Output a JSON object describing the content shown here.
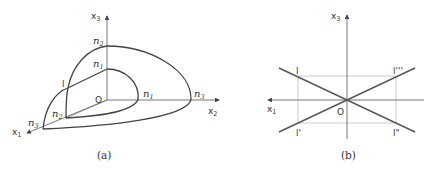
{
  "figure_a": {
    "caption": "(a)",
    "axes": {
      "x1": {
        "base": "x",
        "sub": "1"
      },
      "x2": {
        "base": "x",
        "sub": "2"
      },
      "x3": {
        "base": "x",
        "sub": "3"
      }
    },
    "origin_label": "O",
    "point_labels": {
      "n1_top": {
        "base": "n",
        "sub": "1"
      },
      "n1_right": {
        "base": "n",
        "sub": "1"
      },
      "n2_top": {
        "base": "n",
        "sub": "2"
      },
      "n2_left": {
        "base": "n",
        "sub": "2"
      },
      "n3_left": {
        "base": "n",
        "sub": "3"
      },
      "n3_right": {
        "base": "n",
        "sub": "3"
      },
      "l": "l"
    }
  },
  "figure_b": {
    "caption": "(b)",
    "axes": {
      "x1": {
        "base": "x",
        "sub": "1"
      },
      "x3": {
        "base": "x",
        "sub": "3"
      }
    },
    "origin_label": "O",
    "point_labels": {
      "l": "l",
      "l_prime": "l'",
      "l_double_prime": "l\"",
      "l_triple_prime": "l'''"
    }
  },
  "colors": {
    "stroke": "#444444",
    "guide": "#aaaaaa",
    "text": "#333333"
  }
}
